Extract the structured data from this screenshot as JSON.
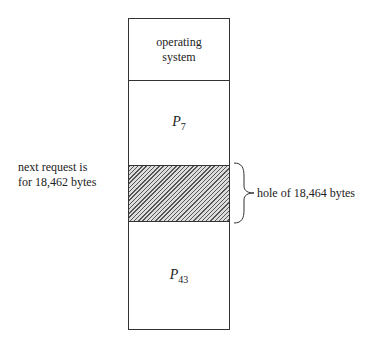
{
  "diagram": {
    "segments": [
      {
        "id": "os",
        "label_line1": "operating",
        "label_line2": "system"
      },
      {
        "id": "p7",
        "label_main": "P",
        "label_sub": "7"
      },
      {
        "id": "hole",
        "label": "hole of 18,464 bytes"
      },
      {
        "id": "p43",
        "label_main": "P",
        "label_sub": "43"
      }
    ],
    "request_note": {
      "line1": "next request is",
      "line2": "for 18,462 bytes"
    },
    "colors": {
      "outline": "#333333",
      "hatch": "#555555",
      "background": "#ffffff"
    }
  }
}
